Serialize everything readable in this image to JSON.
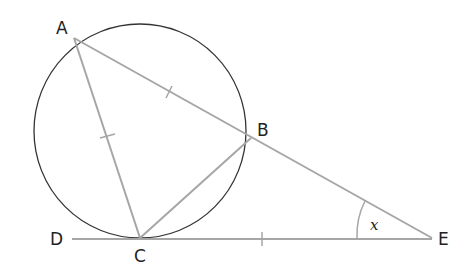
{
  "diagram": {
    "points": {
      "A": {
        "label": "A"
      },
      "B": {
        "label": "B"
      },
      "C": {
        "label": "C"
      },
      "D": {
        "label": "D"
      },
      "E": {
        "label": "E"
      }
    },
    "angle_label": "x",
    "colors": {
      "circle": "#333333",
      "lines": "#a6a6a6",
      "text": "#222222"
    }
  }
}
